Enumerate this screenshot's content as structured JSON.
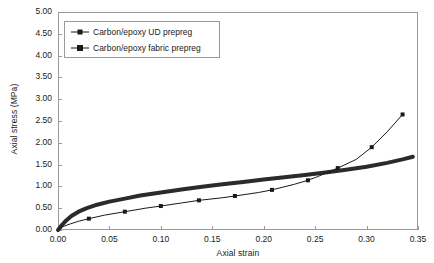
{
  "chart_data": {
    "type": "line",
    "title": "",
    "xlabel": "Axial strain",
    "ylabel": "Axial stress (MPa)",
    "xlim": [
      0.0,
      0.35
    ],
    "ylim": [
      0.0,
      5.0
    ],
    "xticks": [
      "0.00",
      "0.05",
      "0.10",
      "0.15",
      "0.20",
      "0.25",
      "0.30",
      "0.35"
    ],
    "yticks": [
      "0.00",
      "0.50",
      "1.00",
      "1.50",
      "2.00",
      "2.50",
      "3.00",
      "3.50",
      "4.00",
      "4.50",
      "5.00"
    ],
    "grid": false,
    "legend_position": "upper-left",
    "series": [
      {
        "name": "Carbon/epoxy UD prepreg",
        "marker": "square",
        "line_width": 1,
        "color": "#1a1a1a",
        "points": [
          {
            "x": 0.0,
            "y": 0.0
          },
          {
            "x": 0.005,
            "y": 0.08
          },
          {
            "x": 0.012,
            "y": 0.14
          },
          {
            "x": 0.02,
            "y": 0.2
          },
          {
            "x": 0.03,
            "y": 0.26
          },
          {
            "x": 0.045,
            "y": 0.34
          },
          {
            "x": 0.065,
            "y": 0.42
          },
          {
            "x": 0.085,
            "y": 0.5
          },
          {
            "x": 0.1,
            "y": 0.55
          },
          {
            "x": 0.12,
            "y": 0.62
          },
          {
            "x": 0.137,
            "y": 0.68
          },
          {
            "x": 0.16,
            "y": 0.74
          },
          {
            "x": 0.172,
            "y": 0.78
          },
          {
            "x": 0.195,
            "y": 0.86
          },
          {
            "x": 0.208,
            "y": 0.92
          },
          {
            "x": 0.23,
            "y": 1.05
          },
          {
            "x": 0.243,
            "y": 1.14
          },
          {
            "x": 0.252,
            "y": 1.22
          },
          {
            "x": 0.272,
            "y": 1.42
          },
          {
            "x": 0.29,
            "y": 1.62
          },
          {
            "x": 0.305,
            "y": 1.9
          },
          {
            "x": 0.32,
            "y": 2.25
          },
          {
            "x": 0.335,
            "y": 2.65
          }
        ],
        "marker_points": [
          {
            "x": 0.03,
            "y": 0.26
          },
          {
            "x": 0.065,
            "y": 0.42
          },
          {
            "x": 0.1,
            "y": 0.55
          },
          {
            "x": 0.137,
            "y": 0.68
          },
          {
            "x": 0.172,
            "y": 0.78
          },
          {
            "x": 0.208,
            "y": 0.92
          },
          {
            "x": 0.243,
            "y": 1.14
          },
          {
            "x": 0.272,
            "y": 1.42
          },
          {
            "x": 0.305,
            "y": 1.9
          },
          {
            "x": 0.335,
            "y": 2.65
          }
        ]
      },
      {
        "name": "Carbon/epoxy fabric prepreg",
        "marker": "none",
        "line_width": 4,
        "color": "#2b2b2b",
        "points": [
          {
            "x": 0.0,
            "y": 0.0
          },
          {
            "x": 0.004,
            "y": 0.12
          },
          {
            "x": 0.008,
            "y": 0.22
          },
          {
            "x": 0.013,
            "y": 0.32
          },
          {
            "x": 0.02,
            "y": 0.42
          },
          {
            "x": 0.028,
            "y": 0.5
          },
          {
            "x": 0.038,
            "y": 0.58
          },
          {
            "x": 0.05,
            "y": 0.65
          },
          {
            "x": 0.065,
            "y": 0.72
          },
          {
            "x": 0.08,
            "y": 0.79
          },
          {
            "x": 0.1,
            "y": 0.86
          },
          {
            "x": 0.12,
            "y": 0.93
          },
          {
            "x": 0.14,
            "y": 0.99
          },
          {
            "x": 0.16,
            "y": 1.05
          },
          {
            "x": 0.18,
            "y": 1.1
          },
          {
            "x": 0.2,
            "y": 1.16
          },
          {
            "x": 0.22,
            "y": 1.21
          },
          {
            "x": 0.24,
            "y": 1.26
          },
          {
            "x": 0.26,
            "y": 1.32
          },
          {
            "x": 0.28,
            "y": 1.38
          },
          {
            "x": 0.3,
            "y": 1.45
          },
          {
            "x": 0.32,
            "y": 1.54
          },
          {
            "x": 0.335,
            "y": 1.62
          },
          {
            "x": 0.345,
            "y": 1.68
          }
        ],
        "marker_points": []
      }
    ]
  },
  "legend": {
    "items": [
      {
        "label": "Carbon/epoxy UD prepreg"
      },
      {
        "label": "Carbon/epoxy fabric prepreg"
      }
    ]
  },
  "colors": {
    "axis": "#9a9a9a",
    "text": "#1a1a1a",
    "series_ud": "#1a1a1a",
    "series_fabric": "#2b2b2b",
    "background": "#ffffff"
  }
}
